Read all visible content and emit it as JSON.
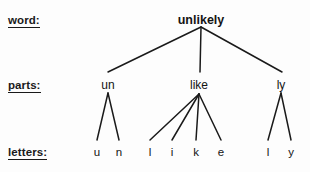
{
  "diagram": {
    "title": "unlikely",
    "type": "morphological-tree",
    "background_color": "#fdfdfd",
    "line_color": "#1a1a1a",
    "text_color": "#141414"
  },
  "row_labels": [
    {
      "id": "word",
      "text": "word:",
      "x": 8,
      "y": 14
    },
    {
      "id": "parts",
      "text": "parts:",
      "x": 8,
      "y": 79
    },
    {
      "id": "letters",
      "text": "letters:",
      "x": 8,
      "y": 146
    }
  ],
  "levels": {
    "word": {
      "label": "word:",
      "nodes": [
        {
          "id": "root",
          "text": "unlikely",
          "x": 201,
          "y": 14
        }
      ]
    },
    "parts": {
      "label": "parts:",
      "nodes": [
        {
          "id": "part-un",
          "text": "un",
          "x": 108,
          "y": 79
        },
        {
          "id": "part-like",
          "text": "like",
          "x": 199,
          "y": 79
        },
        {
          "id": "part-ly",
          "text": "ly",
          "x": 281,
          "y": 79
        }
      ]
    },
    "letters": {
      "label": "letters:",
      "nodes": [
        {
          "id": "letter-u1",
          "text": "u",
          "x": 97,
          "y": 146,
          "parent": "part-un"
        },
        {
          "id": "letter-n",
          "text": "n",
          "x": 119,
          "y": 146,
          "parent": "part-un"
        },
        {
          "id": "letter-l1",
          "text": "l",
          "x": 150,
          "y": 146,
          "parent": "part-like"
        },
        {
          "id": "letter-i",
          "text": "i",
          "x": 172,
          "y": 146,
          "parent": "part-like"
        },
        {
          "id": "letter-k",
          "text": "k",
          "x": 196,
          "y": 146,
          "parent": "part-like"
        },
        {
          "id": "letter-e",
          "text": "e",
          "x": 221,
          "y": 146,
          "parent": "part-like"
        },
        {
          "id": "letter-l2",
          "text": "l",
          "x": 268,
          "y": 146,
          "parent": "part-ly"
        },
        {
          "id": "letter-y",
          "text": "y",
          "x": 291,
          "y": 146,
          "parent": "part-ly"
        }
      ]
    }
  },
  "edges": [
    {
      "from": "root",
      "to": "part-un",
      "x1": 201,
      "y1": 27,
      "x2": 108,
      "y2": 72
    },
    {
      "from": "root",
      "to": "part-like",
      "x1": 201,
      "y1": 27,
      "x2": 200,
      "y2": 72
    },
    {
      "from": "root",
      "to": "part-ly",
      "x1": 201,
      "y1": 27,
      "x2": 282,
      "y2": 72
    },
    {
      "from": "part-un",
      "to": "letter-u1",
      "x1": 108,
      "y1": 93,
      "x2": 97,
      "y2": 140
    },
    {
      "from": "part-un",
      "to": "letter-n",
      "x1": 108,
      "y1": 93,
      "x2": 119,
      "y2": 140
    },
    {
      "from": "part-like",
      "to": "letter-l1",
      "x1": 199,
      "y1": 94,
      "x2": 150,
      "y2": 140
    },
    {
      "from": "part-like",
      "to": "letter-i",
      "x1": 199,
      "y1": 94,
      "x2": 172,
      "y2": 140
    },
    {
      "from": "part-like",
      "to": "letter-k",
      "x1": 199,
      "y1": 94,
      "x2": 196,
      "y2": 140
    },
    {
      "from": "part-like",
      "to": "letter-e",
      "x1": 199,
      "y1": 94,
      "x2": 221,
      "y2": 140
    },
    {
      "from": "part-ly",
      "to": "letter-l2",
      "x1": 281,
      "y1": 93,
      "x2": 268,
      "y2": 140
    },
    {
      "from": "part-ly",
      "to": "letter-y",
      "x1": 281,
      "y1": 93,
      "x2": 291,
      "y2": 140
    }
  ]
}
